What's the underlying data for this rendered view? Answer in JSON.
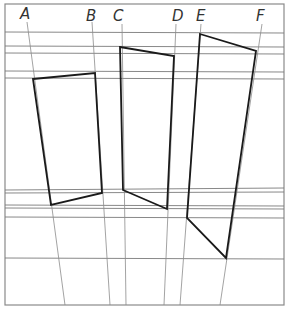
{
  "diagram": {
    "title": "",
    "labels": [
      "A",
      "B",
      "C",
      "D",
      "E",
      "F"
    ],
    "shapes": [
      {
        "name": "quadrilateral-1",
        "between": [
          "A",
          "B"
        ]
      },
      {
        "name": "quadrilateral-2",
        "between": [
          "C",
          "D"
        ]
      },
      {
        "name": "quadrilateral-3",
        "between": [
          "E",
          "F"
        ]
      }
    ],
    "colors": {
      "shape_stroke": "#1a1a1a",
      "guide_stroke": "#7a7a7a",
      "background": "#ffffff"
    }
  }
}
